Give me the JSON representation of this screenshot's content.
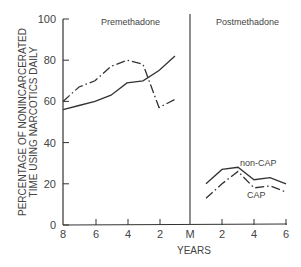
{
  "chart_data": {
    "type": "line",
    "title": "",
    "ylabel_line1": "PERCENTAGE OF NONINCARCERATED",
    "ylabel_line2": "TIME USING NARCOTICS DAILY",
    "xlabel": "YEARS",
    "ylim": [
      0,
      100
    ],
    "yticks": [
      "0",
      "20",
      "40",
      "60",
      "80",
      "100"
    ],
    "xticks": [
      "8",
      "6",
      "4",
      "2",
      "M",
      "2",
      "4",
      "6"
    ],
    "grid": false,
    "panels": [
      {
        "label": "Premethadone",
        "x_years_before": [
          8,
          7,
          6,
          5,
          4,
          3,
          2,
          1
        ],
        "series": [
          {
            "name": "non-CAP",
            "style": "solid",
            "values": [
              56,
              58,
              60,
              63,
              69,
              70,
              75,
              82
            ]
          },
          {
            "name": "CAP",
            "style": "dash-dot",
            "values": [
              60,
              67,
              70,
              77,
              80,
              78,
              57,
              61
            ]
          }
        ]
      },
      {
        "label": "Postmethadone",
        "x_years_after": [
          1,
          2,
          3,
          4,
          5,
          6
        ],
        "series": [
          {
            "name": "non-CAP",
            "style": "solid",
            "values": [
              20,
              27,
              28,
              22,
              23,
              20
            ]
          },
          {
            "name": "CAP",
            "style": "dash-dot",
            "values": [
              13,
              20,
              26,
              18,
              19,
              16
            ]
          }
        ]
      }
    ],
    "annotations": [
      "Premethadone",
      "Postmethadone",
      "non-CAP",
      "CAP"
    ]
  }
}
